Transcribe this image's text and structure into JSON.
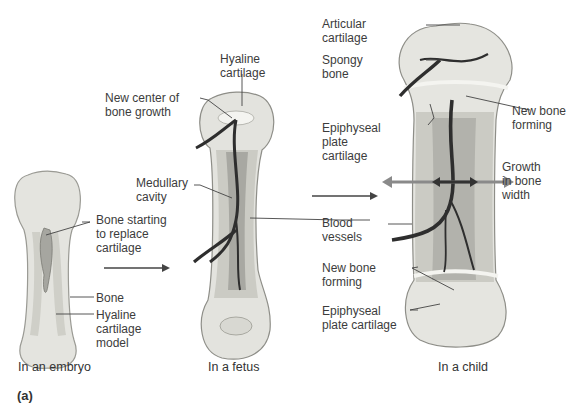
{
  "figure": {
    "panel_label": "(a)",
    "stages": [
      {
        "id": "embryo",
        "caption": "In an embryo",
        "labels": {
          "bone_replace": [
            "Bone starting",
            "to replace",
            "cartilage"
          ],
          "bone": [
            "Bone"
          ],
          "hyaline_model": [
            "Hyaline",
            "cartilage",
            "model"
          ]
        }
      },
      {
        "id": "fetus",
        "caption": "In a fetus",
        "labels": {
          "hyaline": [
            "Hyaline",
            "cartilage"
          ],
          "new_center": [
            "New center of",
            "bone growth"
          ],
          "medullary": [
            "Medullary",
            "cavity"
          ],
          "blood_vessels": [
            "Blood",
            "vessels"
          ]
        }
      },
      {
        "id": "child",
        "caption": "In a child",
        "labels": {
          "articular": [
            "Articular",
            "cartilage"
          ],
          "spongy": [
            "Spongy",
            "bone"
          ],
          "epiphyseal_top": [
            "Epiphyseal",
            "plate",
            "cartilage"
          ],
          "new_bone_top": [
            "New bone",
            "forming"
          ],
          "growth_width": [
            "Growth",
            "in bone",
            "width"
          ],
          "new_bone_bottom": [
            "New bone",
            "forming"
          ],
          "epiphyseal_bottom": [
            "Epiphyseal",
            "plate cartilage"
          ]
        }
      }
    ],
    "colors": {
      "cartilage": "#e6e6e0",
      "bone": "#c9c9c2",
      "bone_dark": "#9e9e98",
      "vessel": "#2e2e2e",
      "arrow_gray": "#8a8a8a",
      "leader": "#444444"
    }
  }
}
